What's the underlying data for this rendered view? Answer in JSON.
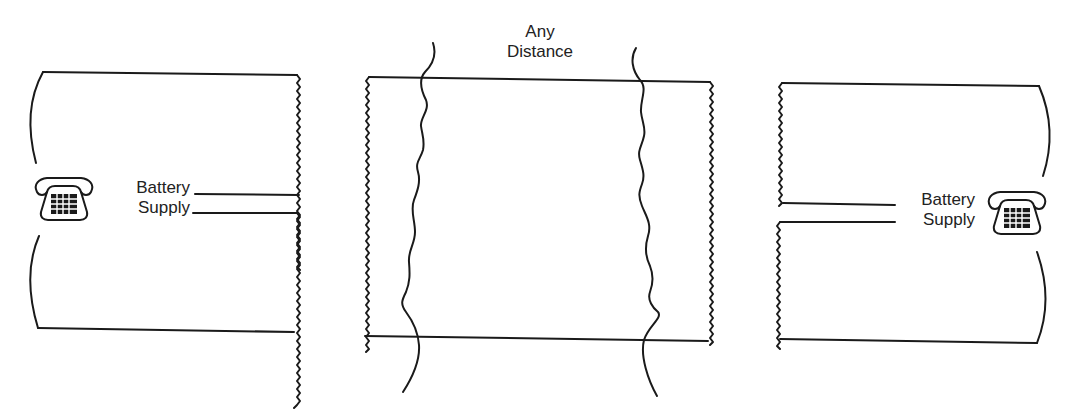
{
  "diagram": {
    "left_station": {
      "label_line1": "Battery",
      "label_line2": "Supply",
      "icon": "telephone-icon"
    },
    "middle_section": {
      "label_line1": "Any",
      "label_line2": "Distance"
    },
    "right_station": {
      "label_line1": "Battery",
      "label_line2": "Supply",
      "icon": "telephone-icon"
    },
    "colors": {
      "line": "#1a1a1a",
      "background": "#ffffff"
    }
  }
}
